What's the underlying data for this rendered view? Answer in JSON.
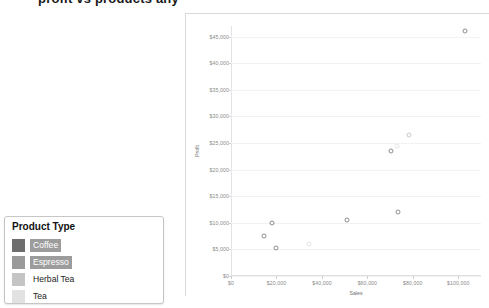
{
  "title": "profit vs products any",
  "chart_panel": {
    "y_axis_title": "Profit",
    "x_axis_title": "Sales",
    "y_ticks": [
      "$45,000",
      "$40,000",
      "$35,000",
      "$30,000",
      "$25,000",
      "$20,000",
      "$15,000",
      "$10,000",
      "$5,000",
      "$0"
    ],
    "x_ticks": [
      "$0",
      "$20,000",
      "$40,000",
      "$60,000",
      "$80,000",
      "$100,000"
    ]
  },
  "legend": {
    "title": "Product Type",
    "items": [
      {
        "label": "Coffee",
        "color": "#6e6e6e",
        "selected": true
      },
      {
        "label": "Espresso",
        "color": "#9a9a9a",
        "selected": true
      },
      {
        "label": "Herbal Tea",
        "color": "#c4c4c4",
        "selected": false
      },
      {
        "label": "Tea",
        "color": "#e2e2e2",
        "selected": false
      }
    ]
  },
  "chart_data": {
    "type": "scatter",
    "title": "profit vs products any",
    "xlabel": "Sales",
    "ylabel": "Profit",
    "xlim": [
      0,
      110000
    ],
    "ylim": [
      0,
      47000
    ],
    "grid": true,
    "legend_position": "bottom-left",
    "xticks": [
      0,
      20000,
      40000,
      60000,
      80000,
      100000
    ],
    "yticks": [
      0,
      5000,
      10000,
      15000,
      20000,
      25000,
      30000,
      35000,
      40000,
      45000
    ],
    "series": [
      {
        "name": "Coffee",
        "color": "#8d8d8d",
        "points": [
          {
            "x": 103000,
            "y": 46000
          },
          {
            "x": 70500,
            "y": 23500
          },
          {
            "x": 73500,
            "y": 12000
          },
          {
            "x": 51000,
            "y": 10500
          },
          {
            "x": 18000,
            "y": 10000
          },
          {
            "x": 14500,
            "y": 7500
          },
          {
            "x": 20000,
            "y": 5200
          }
        ]
      },
      {
        "name": "Espresso",
        "color": "#c9c9c9",
        "points": [
          {
            "x": 78500,
            "y": 26500
          }
        ]
      },
      {
        "name": "Herbal Tea",
        "color": "#e4e4e4",
        "points": [
          {
            "x": 73000,
            "y": 24500
          },
          {
            "x": 34500,
            "y": 6000
          }
        ]
      }
    ]
  }
}
